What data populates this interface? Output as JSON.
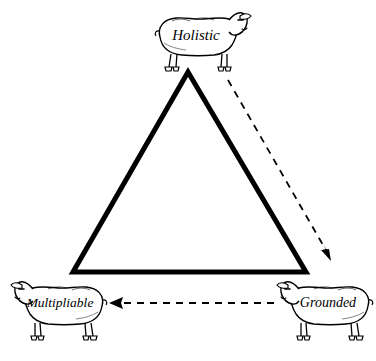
{
  "figure": {
    "type": "triangle-relationship-diagram",
    "background_color": "#ffffff",
    "ink_color": "#000000",
    "nodes": [
      {
        "id": "holistic",
        "label": "Holistic",
        "icon": "sheep-icon",
        "icon_facing": "right",
        "position": "top",
        "x": 196,
        "y": 38
      },
      {
        "id": "multipliable",
        "label": "Multipliable",
        "icon": "sheep-icon",
        "icon_facing": "left",
        "position": "bottom-left",
        "x": 60,
        "y": 304
      },
      {
        "id": "grounded",
        "label": "Grounded",
        "icon": "sheep-icon",
        "icon_facing": "left",
        "position": "bottom-right",
        "x": 328,
        "y": 304
      }
    ],
    "triangle": {
      "stroke_color": "#000000",
      "stroke_width": 5,
      "apex": [
        188,
        72
      ],
      "bottom_left": [
        73,
        272
      ],
      "bottom_right": [
        306,
        272
      ]
    },
    "arrows": [
      {
        "id": "holistic-to-grounded",
        "from": "holistic",
        "to": "grounded",
        "style": "dashed",
        "direction": "down-right",
        "start": [
          228,
          80
        ],
        "end": [
          330,
          258
        ]
      },
      {
        "id": "grounded-to-multipliable",
        "from": "grounded",
        "to": "multipliable",
        "style": "dashed",
        "direction": "left",
        "start": [
          274,
          303
        ],
        "end": [
          110,
          303
        ]
      }
    ]
  }
}
